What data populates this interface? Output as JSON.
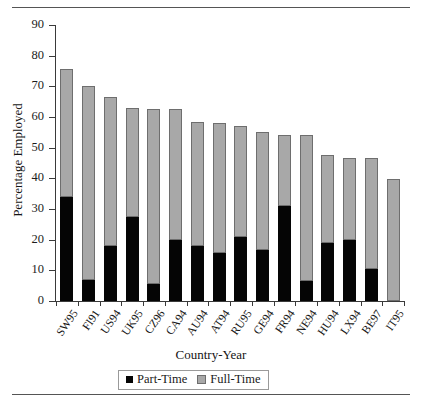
{
  "figure": {
    "top_rule": true,
    "bottom_rule": true
  },
  "legend": {
    "position": "bottom-center",
    "items": [
      {
        "label": "Part-Time",
        "color": "#050505",
        "marker": "filled-square"
      },
      {
        "label": "Full-Time",
        "color": "#a8a8a8",
        "marker": "shaded-square"
      }
    ]
  },
  "chart_data": {
    "type": "bar",
    "subtype": "stacked",
    "title": "",
    "xlabel": "Country-Year",
    "ylabel": "Percentage Employed",
    "ylim": [
      0,
      90
    ],
    "ytick_step": 10,
    "yticks": [
      0,
      10,
      20,
      30,
      40,
      50,
      60,
      70,
      80,
      90
    ],
    "grid": false,
    "legend_position": "bottom-center",
    "categories": [
      "SW95",
      "FI91",
      "US94",
      "UK95",
      "CZ96",
      "CA94",
      "AU94",
      "AT94",
      "RU95",
      "GE94",
      "FR94",
      "NE94",
      "HU94",
      "LX94",
      "BE97",
      "IT95"
    ],
    "series": [
      {
        "name": "Part-Time",
        "color": "#050505",
        "values": [
          34.0,
          7.0,
          18.0,
          27.5,
          5.5,
          20.0,
          18.0,
          15.5,
          21.0,
          16.5,
          31.0,
          6.5,
          19.0,
          20.0,
          10.5,
          0.0
        ]
      },
      {
        "name": "Full-Time",
        "color": "#a8a8a8",
        "values": [
          41.5,
          63.0,
          48.5,
          35.5,
          57.0,
          42.5,
          40.5,
          42.5,
          36.0,
          38.5,
          23.0,
          47.5,
          28.5,
          26.5,
          36.0,
          39.8
        ]
      }
    ],
    "totals": [
      75.5,
      70.0,
      66.5,
      63.0,
      62.5,
      62.5,
      58.5,
      58.0,
      57.0,
      55.0,
      54.0,
      54.0,
      47.5,
      46.5,
      46.5,
      39.8
    ]
  }
}
